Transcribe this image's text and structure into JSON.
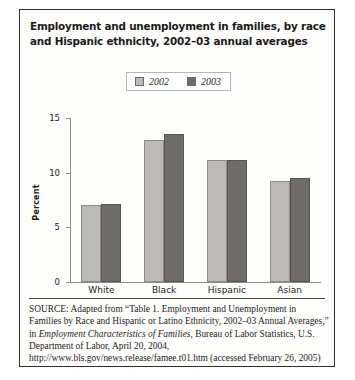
{
  "figure": {
    "title": "Employment and unemployment in families, by race and Hispanic ethnicity, 2002–03 annual averages",
    "source_prefix": "SOURCE:",
    "source_part1": " Adapted from “Table 1. Employment and Unemployment in Families by Race and Hispanic or Latino Ethnicity, 2002–03 Annual Averages,” in ",
    "source_italic": "Employment Characteristics of Families",
    "source_part2": ", Bureau of Labor Statistics, U.S. Department of Labor, April 20, 2004, http://www.bls.gov/news.release/famee.t01.htm (accessed February 26, 2005)"
  },
  "colors": {
    "series_2002": "#bcbab7",
    "series_2003": "#6f6d6b",
    "border": "#33302f",
    "axis": "#8d8b88"
  },
  "chart_data": {
    "type": "bar",
    "title": "Employment and unemployment in families, by race and Hispanic ethnicity, 2002–03 annual averages",
    "xlabel": "",
    "ylabel": "Percent",
    "categories": [
      "White",
      "Black",
      "Hispanic",
      "Asian"
    ],
    "series": [
      {
        "name": "2002",
        "values": [
          7.0,
          13.0,
          11.2,
          9.2
        ]
      },
      {
        "name": "2003",
        "values": [
          7.1,
          13.5,
          11.2,
          9.5
        ]
      }
    ],
    "ylim": [
      0,
      15
    ],
    "yticks": [
      0,
      5,
      10,
      15
    ],
    "ytick_labels": [
      "0",
      "5",
      "10",
      "15"
    ],
    "grid": false,
    "legend_position": "top-center",
    "legend_entries": [
      "2002",
      "2003"
    ]
  }
}
